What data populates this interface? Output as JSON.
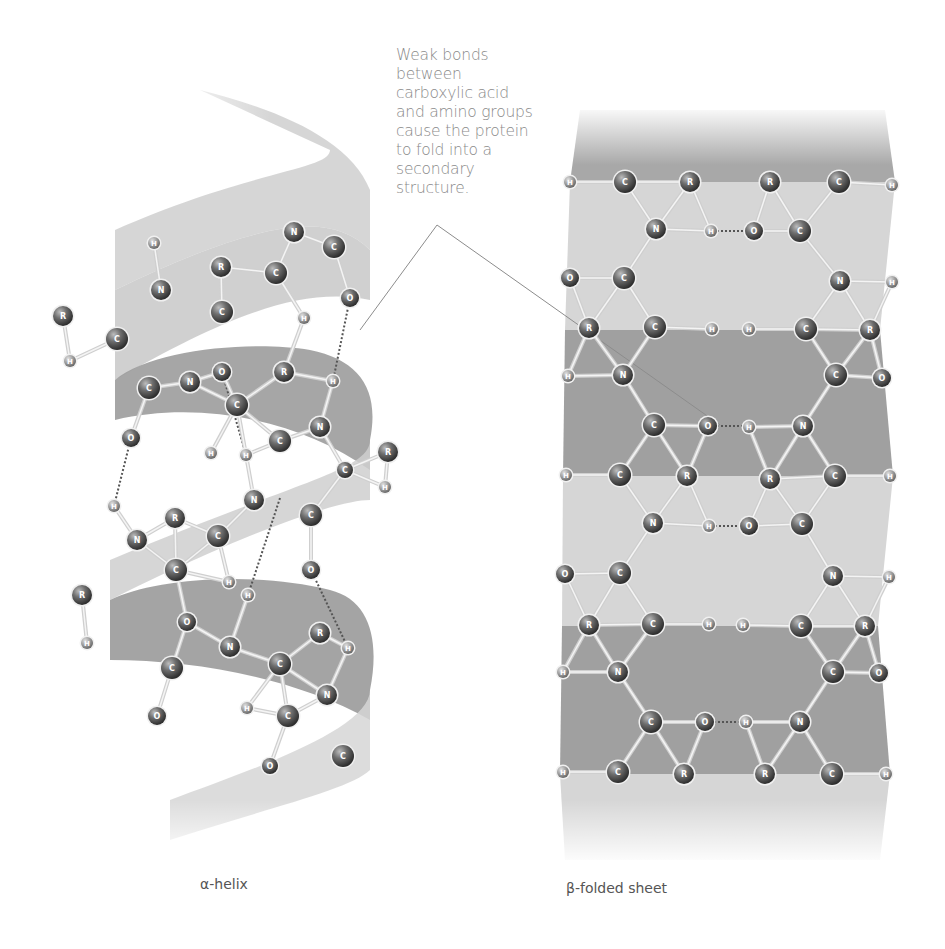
{
  "annotation": {
    "lines": [
      "Weak bonds",
      "between",
      "carboxylic acid",
      "and amino groups",
      "cause the protein",
      "to fold into a",
      "secondary",
      "structure."
    ]
  },
  "labels": {
    "helix": "α-helix",
    "sheet": "β-folded sheet"
  },
  "colors": {
    "ribbon_light": "#d4d4d4",
    "ribbon_dark": "#9a9a9a",
    "atom": "#5a5a5a",
    "text": "#8a8a8a"
  },
  "helix_atoms": [
    {
      "el": "N",
      "x": 294,
      "y": 232,
      "r": 10
    },
    {
      "el": "C",
      "x": 334,
      "y": 247,
      "r": 11
    },
    {
      "el": "R",
      "x": 221,
      "y": 267,
      "r": 10
    },
    {
      "el": "C",
      "x": 276,
      "y": 273,
      "r": 11
    },
    {
      "el": "O",
      "x": 350,
      "y": 298,
      "r": 9
    },
    {
      "el": "H",
      "x": 154,
      "y": 243,
      "r": 6
    },
    {
      "el": "N",
      "x": 161,
      "y": 290,
      "r": 10
    },
    {
      "el": "C",
      "x": 222,
      "y": 312,
      "r": 11
    },
    {
      "el": "H",
      "x": 304,
      "y": 318,
      "r": 6
    },
    {
      "el": "R",
      "x": 63,
      "y": 316,
      "r": 10
    },
    {
      "el": "C",
      "x": 117,
      "y": 339,
      "r": 11
    },
    {
      "el": "H",
      "x": 70,
      "y": 361,
      "r": 6
    },
    {
      "el": "C",
      "x": 149,
      "y": 388,
      "r": 11
    },
    {
      "el": "N",
      "x": 190,
      "y": 382,
      "r": 10
    },
    {
      "el": "O",
      "x": 222,
      "y": 372,
      "r": 9
    },
    {
      "el": "R",
      "x": 284,
      "y": 372,
      "r": 10
    },
    {
      "el": "H",
      "x": 333,
      "y": 381,
      "r": 6
    },
    {
      "el": "C",
      "x": 237,
      "y": 405,
      "r": 11
    },
    {
      "el": "N",
      "x": 320,
      "y": 427,
      "r": 10
    },
    {
      "el": "C",
      "x": 280,
      "y": 441,
      "r": 11
    },
    {
      "el": "O",
      "x": 131,
      "y": 438,
      "r": 9
    },
    {
      "el": "H",
      "x": 211,
      "y": 453,
      "r": 6
    },
    {
      "el": "H",
      "x": 246,
      "y": 455,
      "r": 6
    },
    {
      "el": "R",
      "x": 388,
      "y": 452,
      "r": 10
    },
    {
      "el": "H",
      "x": 385,
      "y": 487,
      "r": 6
    },
    {
      "el": "C",
      "x": 345,
      "y": 470,
      "r": 8
    },
    {
      "el": "H",
      "x": 114,
      "y": 506,
      "r": 6
    },
    {
      "el": "N",
      "x": 254,
      "y": 500,
      "r": 10
    },
    {
      "el": "C",
      "x": 311,
      "y": 515,
      "r": 11
    },
    {
      "el": "R",
      "x": 175,
      "y": 518,
      "r": 10
    },
    {
      "el": "N",
      "x": 137,
      "y": 540,
      "r": 10
    },
    {
      "el": "C",
      "x": 218,
      "y": 536,
      "r": 11
    },
    {
      "el": "C",
      "x": 176,
      "y": 570,
      "r": 11
    },
    {
      "el": "O",
      "x": 311,
      "y": 570,
      "r": 9
    },
    {
      "el": "H",
      "x": 229,
      "y": 582,
      "r": 6
    },
    {
      "el": "R",
      "x": 82,
      "y": 595,
      "r": 10
    },
    {
      "el": "H",
      "x": 248,
      "y": 595,
      "r": 6
    },
    {
      "el": "O",
      "x": 187,
      "y": 622,
      "r": 9
    },
    {
      "el": "H",
      "x": 87,
      "y": 643,
      "r": 6
    },
    {
      "el": "N",
      "x": 230,
      "y": 647,
      "r": 10
    },
    {
      "el": "R",
      "x": 320,
      "y": 633,
      "r": 10
    },
    {
      "el": "H",
      "x": 348,
      "y": 648,
      "r": 6
    },
    {
      "el": "C",
      "x": 172,
      "y": 668,
      "r": 11
    },
    {
      "el": "C",
      "x": 280,
      "y": 664,
      "r": 11
    },
    {
      "el": "N",
      "x": 327,
      "y": 695,
      "r": 10
    },
    {
      "el": "C",
      "x": 288,
      "y": 716,
      "r": 11
    },
    {
      "el": "O",
      "x": 157,
      "y": 716,
      "r": 9
    },
    {
      "el": "H",
      "x": 247,
      "y": 708,
      "r": 6
    },
    {
      "el": "O",
      "x": 270,
      "y": 766,
      "r": 8
    },
    {
      "el": "C",
      "x": 343,
      "y": 756,
      "r": 11
    }
  ],
  "sheet_atoms": [
    {
      "el": "H",
      "x": 570,
      "y": 182,
      "r": 6
    },
    {
      "el": "C",
      "x": 625,
      "y": 182,
      "r": 11
    },
    {
      "el": "R",
      "x": 690,
      "y": 182,
      "r": 10
    },
    {
      "el": "R",
      "x": 770,
      "y": 182,
      "r": 10
    },
    {
      "el": "C",
      "x": 839,
      "y": 182,
      "r": 11
    },
    {
      "el": "H",
      "x": 892,
      "y": 185,
      "r": 6
    },
    {
      "el": "N",
      "x": 656,
      "y": 229,
      "r": 10
    },
    {
      "el": "H",
      "x": 711,
      "y": 231,
      "r": 6
    },
    {
      "el": "O",
      "x": 754,
      "y": 231,
      "r": 9
    },
    {
      "el": "C",
      "x": 800,
      "y": 231,
      "r": 11
    },
    {
      "el": "O",
      "x": 570,
      "y": 278,
      "r": 9
    },
    {
      "el": "C",
      "x": 624,
      "y": 278,
      "r": 11
    },
    {
      "el": "N",
      "x": 840,
      "y": 281,
      "r": 10
    },
    {
      "el": "H",
      "x": 892,
      "y": 282,
      "r": 6
    },
    {
      "el": "R",
      "x": 589,
      "y": 328,
      "r": 10
    },
    {
      "el": "C",
      "x": 655,
      "y": 327,
      "r": 11
    },
    {
      "el": "H",
      "x": 712,
      "y": 329,
      "r": 6
    },
    {
      "el": "H",
      "x": 749,
      "y": 329,
      "r": 6
    },
    {
      "el": "C",
      "x": 806,
      "y": 329,
      "r": 11
    },
    {
      "el": "R",
      "x": 870,
      "y": 330,
      "r": 10
    },
    {
      "el": "H",
      "x": 568,
      "y": 376,
      "r": 6
    },
    {
      "el": "N",
      "x": 623,
      "y": 375,
      "r": 10
    },
    {
      "el": "C",
      "x": 836,
      "y": 375,
      "r": 11
    },
    {
      "el": "O",
      "x": 882,
      "y": 378,
      "r": 9
    },
    {
      "el": "C",
      "x": 654,
      "y": 425,
      "r": 11
    },
    {
      "el": "O",
      "x": 708,
      "y": 426,
      "r": 9
    },
    {
      "el": "H",
      "x": 749,
      "y": 427,
      "r": 6
    },
    {
      "el": "N",
      "x": 803,
      "y": 426,
      "r": 10
    },
    {
      "el": "H",
      "x": 566,
      "y": 475,
      "r": 6
    },
    {
      "el": "C",
      "x": 620,
      "y": 475,
      "r": 11
    },
    {
      "el": "R",
      "x": 687,
      "y": 476,
      "r": 10
    },
    {
      "el": "R",
      "x": 770,
      "y": 479,
      "r": 10
    },
    {
      "el": "C",
      "x": 835,
      "y": 476,
      "r": 11
    },
    {
      "el": "H",
      "x": 890,
      "y": 476,
      "r": 6
    },
    {
      "el": "N",
      "x": 653,
      "y": 523,
      "r": 10
    },
    {
      "el": "H",
      "x": 709,
      "y": 526,
      "r": 6
    },
    {
      "el": "O",
      "x": 749,
      "y": 526,
      "r": 9
    },
    {
      "el": "C",
      "x": 802,
      "y": 524,
      "r": 11
    },
    {
      "el": "O",
      "x": 565,
      "y": 574,
      "r": 9
    },
    {
      "el": "C",
      "x": 620,
      "y": 573,
      "r": 11
    },
    {
      "el": "N",
      "x": 833,
      "y": 576,
      "r": 10
    },
    {
      "el": "H",
      "x": 889,
      "y": 577,
      "r": 6
    },
    {
      "el": "R",
      "x": 589,
      "y": 625,
      "r": 10
    },
    {
      "el": "C",
      "x": 653,
      "y": 624,
      "r": 11
    },
    {
      "el": "H",
      "x": 709,
      "y": 624,
      "r": 6
    },
    {
      "el": "H",
      "x": 743,
      "y": 625,
      "r": 6
    },
    {
      "el": "C",
      "x": 801,
      "y": 626,
      "r": 11
    },
    {
      "el": "R",
      "x": 865,
      "y": 626,
      "r": 10
    },
    {
      "el": "H",
      "x": 563,
      "y": 672,
      "r": 6
    },
    {
      "el": "N",
      "x": 618,
      "y": 672,
      "r": 10
    },
    {
      "el": "C",
      "x": 833,
      "y": 672,
      "r": 11
    },
    {
      "el": "O",
      "x": 879,
      "y": 673,
      "r": 9
    },
    {
      "el": "C",
      "x": 651,
      "y": 722,
      "r": 11
    },
    {
      "el": "O",
      "x": 705,
      "y": 722,
      "r": 9
    },
    {
      "el": "H",
      "x": 746,
      "y": 722,
      "r": 6
    },
    {
      "el": "N",
      "x": 800,
      "y": 722,
      "r": 10
    },
    {
      "el": "H",
      "x": 563,
      "y": 772,
      "r": 6
    },
    {
      "el": "C",
      "x": 618,
      "y": 772,
      "r": 11
    },
    {
      "el": "R",
      "x": 684,
      "y": 774,
      "r": 10
    },
    {
      "el": "R",
      "x": 765,
      "y": 774,
      "r": 10
    },
    {
      "el": "C",
      "x": 832,
      "y": 774,
      "r": 11
    },
    {
      "el": "H",
      "x": 886,
      "y": 774,
      "r": 6
    }
  ]
}
